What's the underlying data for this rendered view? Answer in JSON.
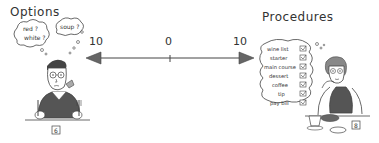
{
  "left": {
    "title": "Options",
    "thought_bubbles": [
      "red ? white ?",
      "soup ?"
    ],
    "table_number": "6"
  },
  "right": {
    "title": "Procedures",
    "checklist": [
      {
        "label": "wine list",
        "checked": true
      },
      {
        "label": "starter",
        "checked": true
      },
      {
        "label": "main course",
        "checked": true
      },
      {
        "label": "dessert",
        "checked": true
      },
      {
        "label": "coffee",
        "checked": true
      },
      {
        "label": "tip",
        "checked": true
      },
      {
        "label": "pay bill",
        "checked": true
      }
    ],
    "table_number": "8"
  },
  "scale": {
    "left_label": "10",
    "center_label": "0",
    "right_label": "10"
  },
  "colors": {
    "ink": "#333333",
    "arrow_fill": "#666666",
    "shirt": "#555555",
    "background": "#ffffff"
  }
}
